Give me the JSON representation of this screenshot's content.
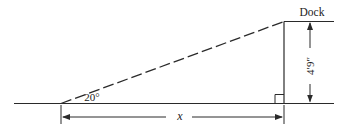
{
  "diagram": {
    "type": "geometry-right-triangle",
    "labels": {
      "dock": "Dock",
      "angle": "20°",
      "height": "4′9″",
      "base": "x"
    },
    "geometry": {
      "angle_degrees": 20,
      "opposite_side": "4′9″",
      "adjacent_side": "x",
      "hypotenuse_style": "dashed",
      "right_angle_marker": true
    },
    "colors": {
      "line": "#2a2a2a",
      "background": "#ffffff"
    }
  }
}
